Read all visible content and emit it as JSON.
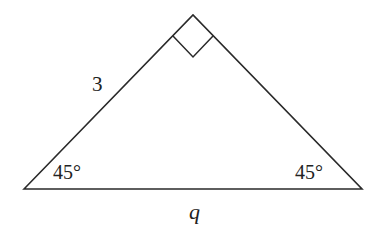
{
  "diagram": {
    "type": "right-isosceles-triangle",
    "colors": {
      "stroke": "#2a2a2a",
      "background": "#ffffff",
      "text": "#222222"
    },
    "labels": {
      "leg": "3",
      "hypotenuse": "q",
      "left_angle": "45°",
      "right_angle": "45°"
    },
    "right_angle_marker": true
  }
}
